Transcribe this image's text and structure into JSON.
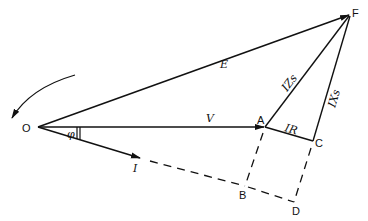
{
  "diagram": {
    "type": "phasor-diagram",
    "points": {
      "O": {
        "label": "O",
        "x": 38,
        "y": 127
      },
      "A": {
        "label": "A",
        "x": 265,
        "y": 127
      },
      "B": {
        "label": "B",
        "x": 245,
        "y": 186
      },
      "C": {
        "label": "C",
        "x": 313,
        "y": 141
      },
      "D": {
        "label": "D",
        "x": 294,
        "y": 202
      },
      "F": {
        "label": "F",
        "x": 350,
        "y": 14
      }
    },
    "phasors": {
      "E": {
        "label": "E",
        "from": "O",
        "to": "F"
      },
      "V": {
        "label": "V",
        "from": "O",
        "to": "A"
      },
      "I": {
        "label": "I",
        "from": "O",
        "to_xy": [
          140,
          158
        ]
      },
      "IZs": {
        "label": "IZs",
        "from": "A",
        "to": "F"
      },
      "IR": {
        "label": "IR",
        "from": "A",
        "to": "C"
      },
      "IXs": {
        "label": "IXs",
        "from": "C",
        "to": "F"
      }
    },
    "angle": {
      "label": "φ",
      "between": [
        "V",
        "I"
      ]
    },
    "rotation_arrow": {
      "direction": "counter-clockwise"
    },
    "dashed_lines": [
      [
        "A",
        "B"
      ],
      [
        "C",
        "D"
      ],
      [
        "I_end",
        "B"
      ],
      [
        "B",
        "D"
      ]
    ],
    "line_color": "#111111"
  }
}
